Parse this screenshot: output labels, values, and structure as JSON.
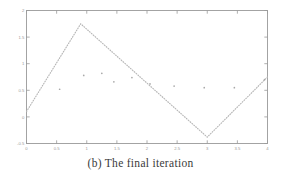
{
  "caption": {
    "text": "(b) The final iteration"
  },
  "colors": {
    "axis": "#9a9a9a",
    "line": "#b6b6b6",
    "marker": "#a8a8a8",
    "tick_label": "#9a9a9a",
    "caption": "#3a3a3a",
    "background": "#ffffff"
  },
  "chart_data": {
    "type": "line",
    "title": "",
    "xlabel": "",
    "ylabel": "",
    "xlim": [
      0,
      4
    ],
    "ylim": [
      -0.5,
      2
    ],
    "grid": false,
    "legend": "none",
    "frame": "box",
    "tick_direction": "in",
    "line_style": "dotted",
    "xticks": [
      0,
      0.5,
      1,
      1.5,
      2,
      2.5,
      3,
      3.5,
      4
    ],
    "xticklabels": [
      "0",
      "0.5",
      "1",
      "1.5",
      "2",
      "2.5",
      "3",
      "3.5",
      "4"
    ],
    "yticks": [
      -0.5,
      0,
      0.5,
      1,
      1.5,
      2
    ],
    "yticklabels": [
      "-0.5",
      "0",
      "0.5",
      "1",
      "1.5",
      "2"
    ],
    "series": [
      {
        "name": "fitted piecewise curve",
        "style": "dotted-line",
        "x": [
          0.0,
          0.9,
          3.0,
          4.0
        ],
        "y": [
          0.1,
          1.75,
          -0.38,
          0.75
        ]
      },
      {
        "name": "data points",
        "style": "scatter",
        "x": [
          0.55,
          0.95,
          1.25,
          1.45,
          1.75,
          2.05,
          2.45,
          2.95,
          3.45,
          3.95
        ],
        "y": [
          0.52,
          0.78,
          0.82,
          0.66,
          0.74,
          0.62,
          0.58,
          0.55,
          0.55,
          0.7
        ]
      }
    ]
  }
}
